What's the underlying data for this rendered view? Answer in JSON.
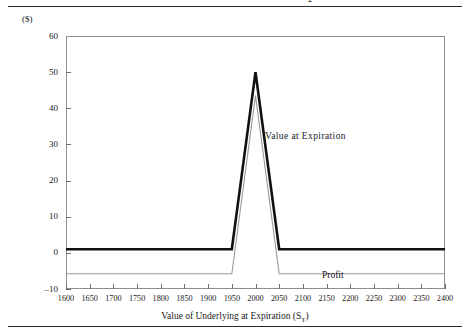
{
  "figure": {
    "title": "Sell Two Calls with Exercise Price X",
    "title_sub": "2",
    "y_unit_label": "($)",
    "x_axis_title": "Value of Underlying at Expiration (S",
    "x_axis_title_sub": "T",
    "x_axis_title_tail": ")"
  },
  "annotations": {
    "value_at_expiration": "Value  at Expiration",
    "profit": "Profit"
  },
  "colors": {
    "value_line": "#111111",
    "profit_line": "#9a9a9a",
    "frame": "#8d8d8d",
    "tick": "#6f6f6f",
    "rule": "#2b2b2b",
    "text": "#1a1a1a"
  },
  "chart_data": {
    "type": "line",
    "title": "Sell Two Calls with Exercise Price X2",
    "xlabel": "Value of Underlying at Expiration (S_T)",
    "ylabel": "($)",
    "xlim": [
      1600,
      2400
    ],
    "ylim": [
      -10,
      60
    ],
    "xticks": [
      1600,
      1650,
      1700,
      1750,
      1800,
      1850,
      1900,
      1950,
      2000,
      2050,
      2100,
      2150,
      2200,
      2250,
      2300,
      2350,
      2400
    ],
    "yticks": [
      -10,
      0,
      10,
      20,
      30,
      40,
      50,
      60
    ],
    "grid": false,
    "legend": "annotations-inline",
    "series": [
      {
        "name": "Value  at Expiration",
        "color": "#111111",
        "width": 2.6,
        "x": [
          1600,
          1950,
          2000,
          2050,
          2400
        ],
        "values": [
          1,
          1,
          50,
          1,
          1
        ]
      },
      {
        "name": "Profit",
        "color": "#9a9a9a",
        "width": 1.1,
        "x": [
          1600,
          1950,
          2000,
          2050,
          2400
        ],
        "values": [
          -5.8,
          -5.8,
          43.5,
          -5.8,
          -5.8
        ]
      }
    ]
  }
}
